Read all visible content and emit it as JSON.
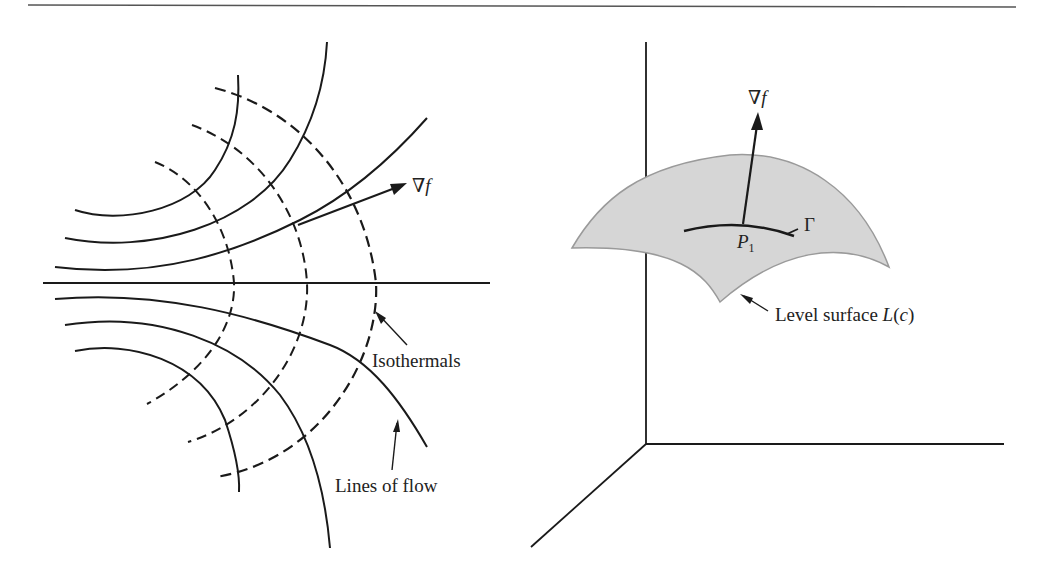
{
  "figure": {
    "left_panel": {
      "title": "Isothermals and lines of flow",
      "labels": {
        "gradient": "∇f",
        "gradient_nabla": "∇",
        "gradient_f": "f",
        "isothermals": "Isothermals",
        "lines_of_flow": "Lines of flow"
      }
    },
    "right_panel": {
      "title": "Level surface with gradient normal",
      "labels": {
        "gradient_nabla": "∇",
        "gradient_f": "f",
        "point_P": "P",
        "point_sub": "1",
        "curve": "Γ",
        "surface_prefix": "Level surface ",
        "surface_L": "L",
        "surface_open": "(",
        "surface_c": "c",
        "surface_close": ")"
      }
    },
    "colors": {
      "ink": "#1a1a1a",
      "surface_fill": "#d6d6d6",
      "surface_edge": "#9a9a9a",
      "rule": "#555555"
    }
  }
}
